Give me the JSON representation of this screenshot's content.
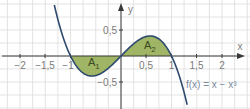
{
  "chart_data": {
    "type": "line",
    "title": "",
    "function_label": "f(x) = x − x³",
    "xlabel": "x",
    "ylabel": "y",
    "xlim": [
      -2.2,
      2.4
    ],
    "ylim": [
      -1.0,
      1.0
    ],
    "grid": true,
    "grid_step": 0.25,
    "x_ticks": [
      -2,
      -1.5,
      -1,
      0.5,
      1,
      1.5,
      2
    ],
    "x_tick_labels": [
      "−2",
      "−1,5",
      "−1",
      "0,5",
      "1",
      "1,5",
      "2"
    ],
    "y_ticks": [
      0.5,
      -0.5
    ],
    "y_tick_labels": [
      "0,5",
      "−0,5"
    ],
    "series": [
      {
        "name": "f(x) = x − x³",
        "color": "#2e4a6e",
        "x": [
          -1.3,
          -1.0,
          -0.75,
          -0.5,
          -0.25,
          0,
          0.25,
          0.5,
          0.75,
          1.0,
          1.3
        ],
        "y": [
          0.897,
          0,
          -0.328,
          -0.375,
          -0.234,
          0,
          0.234,
          0.375,
          0.328,
          0,
          -0.897
        ]
      }
    ],
    "shaded_areas": [
      {
        "name": "A₁",
        "from": -1,
        "to": 0,
        "color": "#8fa84a"
      },
      {
        "name": "A₂",
        "from": 0,
        "to": 1,
        "color": "#8fa84a"
      }
    ]
  },
  "labels": {
    "x_axis": "x",
    "y_axis": "y",
    "function": "f(x) = x − x³",
    "area1": "A",
    "area1_sub": "1",
    "area2": "A",
    "area2_sub": "2",
    "ticks": {
      "xm2": "−2",
      "xm15": "−1,5",
      "xm1": "−1",
      "x05": "0,5",
      "x1": "1",
      "x15": "1,5",
      "x2": "2",
      "y05": "0,5",
      "ym05": "−0,5"
    }
  }
}
